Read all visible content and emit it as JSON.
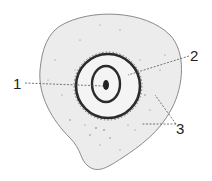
{
  "diagram": {
    "type": "cell cross-section illustration",
    "labels": [
      {
        "id": "1",
        "text": "1",
        "x": 13,
        "y": 76
      },
      {
        "id": "2",
        "text": "2",
        "x": 190,
        "y": 48
      },
      {
        "id": "3",
        "text": "3",
        "x": 176,
        "y": 121
      }
    ],
    "colors": {
      "cytoplasm": "#ececec",
      "outline": "#8a8a8a",
      "ring": "#2a2a2a",
      "leader": "#555555",
      "inner": "#f4f4f4"
    }
  }
}
